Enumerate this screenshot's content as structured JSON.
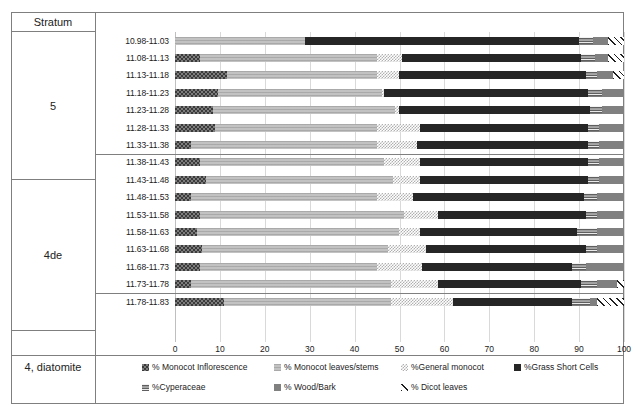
{
  "stratum_column": {
    "header": "Stratum",
    "groups": [
      {
        "label": "5",
        "rows": 7
      },
      {
        "label": "4de",
        "rows": 8
      },
      {
        "label": "4, diatomite",
        "rows": 1
      }
    ]
  },
  "axis": {
    "ticks": [
      "0",
      "10",
      "20",
      "30",
      "40",
      "50",
      "60",
      "70",
      "80",
      "90",
      "100"
    ],
    "min": 0,
    "max": 100
  },
  "legend": {
    "row1": [
      {
        "label": "% Monocot Inflorescence",
        "key": "inflorescence",
        "swatch": "p-inflor"
      },
      {
        "label": "% Monocot leaves/stems",
        "key": "leaves_stems",
        "swatch": "p-leaves"
      },
      {
        "label": "%General monocot",
        "key": "general_monocot",
        "swatch": "p-general"
      },
      {
        "label": "%Grass Short Cells",
        "key": "grass_short_cells",
        "swatch": "p-grass"
      }
    ],
    "row2": [
      {
        "label": "%Cyperaceae",
        "key": "cyperaceae",
        "swatch": "p-cyper"
      },
      {
        "label": "% Wood/Bark",
        "key": "wood_bark",
        "swatch": "p-wood"
      },
      {
        "label": "% Dicot leaves",
        "key": "dicot_leaves",
        "swatch": "p-dicot"
      }
    ]
  },
  "chart_data": {
    "type": "bar",
    "orientation": "horizontal",
    "stacked": true,
    "title": "",
    "xlabel": "",
    "ylabel": "Stratum",
    "xlim": [
      0,
      100
    ],
    "grid": true,
    "legend_position": "bottom",
    "categories": [
      "10.98-11.03",
      "11.08-11.13",
      "11.13-11.18",
      "11.18-11.23",
      "11.23-11.28",
      "11.28-11.33",
      "11.33-11.38",
      "11.38-11.43",
      "11.43-11.48",
      "11.48-11.53",
      "11.53-11.58",
      "11.58-11.63",
      "11.63-11.68",
      "11.68-11.73",
      "11.73-11.78",
      "11.78-11.83"
    ],
    "series": [
      {
        "name": "% Monocot Inflorescence",
        "key": "inflorescence",
        "values": [
          0,
          5.5,
          11.5,
          9.5,
          8.5,
          9.0,
          3.5,
          5.5,
          7.0,
          3.5,
          5.5,
          5.0,
          6.0,
          5.5,
          3.5,
          11.0
        ]
      },
      {
        "name": "% Monocot leaves/stems",
        "key": "leaves_stems",
        "values": [
          29.0,
          39.5,
          33.5,
          36.5,
          40.5,
          36.0,
          41.5,
          41.0,
          41.5,
          41.5,
          45.5,
          45.0,
          41.5,
          39.5,
          44.5,
          37.0
        ]
      },
      {
        "name": "%General monocot",
        "key": "general_monocot",
        "values": [
          0,
          5.5,
          5.0,
          0.5,
          1.0,
          9.5,
          9.0,
          8.0,
          6.0,
          8.0,
          7.5,
          4.5,
          8.5,
          10.0,
          10.5,
          14.0
        ]
      },
      {
        "name": "%Grass Short Cells",
        "key": "grass_short_cells",
        "values": [
          61.0,
          40.0,
          41.5,
          45.5,
          42.5,
          37.5,
          38.0,
          37.5,
          37.5,
          38.0,
          33.0,
          35.0,
          35.5,
          33.5,
          32.0,
          26.5
        ]
      },
      {
        "name": "%Cyperaceae",
        "key": "cyperaceae",
        "values": [
          3.0,
          3.0,
          2.5,
          3.0,
          2.5,
          2.5,
          2.5,
          2.5,
          2.5,
          3.0,
          2.5,
          4.5,
          2.5,
          3.0,
          3.5,
          4.0
        ]
      },
      {
        "name": "% Wood/Bark",
        "key": "wood_bark",
        "values": [
          3.5,
          3.0,
          3.5,
          5.0,
          5.0,
          5.5,
          5.5,
          5.5,
          5.5,
          6.0,
          6.0,
          6.0,
          6.0,
          8.5,
          4.5,
          1.5
        ]
      },
      {
        "name": "% Dicot leaves",
        "key": "dicot_leaves",
        "values": [
          3.5,
          3.5,
          2.5,
          0,
          0,
          0,
          0,
          0,
          0,
          0,
          0,
          0,
          0,
          0,
          1.5,
          6.0
        ]
      }
    ]
  }
}
